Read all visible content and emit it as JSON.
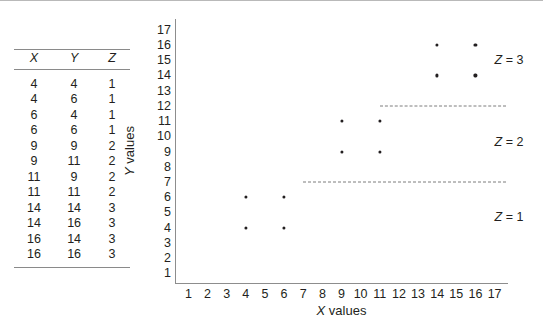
{
  "table": {
    "name": "xyz-data-table",
    "headers": [
      "X",
      "Y",
      "Z"
    ],
    "rows": [
      [
        "4",
        "4",
        "1"
      ],
      [
        "4",
        "6",
        "1"
      ],
      [
        "6",
        "4",
        "1"
      ],
      [
        "6",
        "6",
        "1"
      ],
      [
        "9",
        "9",
        "2"
      ],
      [
        "9",
        "11",
        "2"
      ],
      [
        "11",
        "9",
        "2"
      ],
      [
        "11",
        "11",
        "2"
      ],
      [
        "14",
        "14",
        "3"
      ],
      [
        "14",
        "16",
        "3"
      ],
      [
        "16",
        "14",
        "3"
      ],
      [
        "16",
        "16",
        "3"
      ]
    ]
  },
  "chart_data": {
    "type": "scatter",
    "title": "",
    "xlabel": "X values",
    "ylabel": "Y values",
    "xlim": [
      0.3,
      17.7
    ],
    "ylim": [
      0.3,
      17.7
    ],
    "xticks": [
      1,
      2,
      3,
      4,
      5,
      6,
      7,
      8,
      9,
      10,
      11,
      12,
      13,
      14,
      15,
      16,
      17
    ],
    "yticks": [
      1,
      2,
      3,
      4,
      5,
      6,
      7,
      8,
      9,
      10,
      11,
      12,
      13,
      14,
      15,
      16,
      17
    ],
    "xticklabels": [
      "1",
      "2",
      "3",
      "4",
      "5",
      "6",
      "7",
      "8",
      "9",
      "10",
      "11",
      "12",
      "13",
      "14",
      "15",
      "16",
      "17"
    ],
    "yticklabels": [
      "1",
      "2",
      "3",
      "4",
      "5",
      "6",
      "7",
      "8",
      "9",
      "10",
      "11",
      "12",
      "13",
      "14",
      "15",
      "16",
      "17"
    ],
    "grid": false,
    "legend": "none",
    "marker_color": "#231f20",
    "divider_color": "#7c7c7c",
    "axis_color": "#8d8d8d",
    "points": [
      {
        "x": 4,
        "y": 4,
        "z": 1
      },
      {
        "x": 4,
        "y": 6,
        "z": 1
      },
      {
        "x": 6,
        "y": 4,
        "z": 1
      },
      {
        "x": 6,
        "y": 6,
        "z": 1
      },
      {
        "x": 9,
        "y": 9,
        "z": 2
      },
      {
        "x": 9,
        "y": 11,
        "z": 2
      },
      {
        "x": 11,
        "y": 9,
        "z": 2
      },
      {
        "x": 11,
        "y": 11,
        "z": 2
      },
      {
        "x": 14,
        "y": 14,
        "z": 3
      },
      {
        "x": 14,
        "y": 16,
        "z": 3
      },
      {
        "x": 16,
        "y": 14,
        "z": 3
      },
      {
        "x": 16,
        "y": 16,
        "z": 3
      }
    ],
    "annotations": [
      {
        "text": "Z = 3",
        "symbol": "Z",
        "value": "3",
        "x": 17.0,
        "y": 15
      },
      {
        "text": "Z = 2",
        "symbol": "Z",
        "value": "2",
        "x": 17.0,
        "y": 9.6
      },
      {
        "text": "Z = 1",
        "symbol": "Z",
        "value": "1",
        "x": 17.0,
        "y": 4.7
      }
    ],
    "dividers": [
      {
        "y": 12,
        "x_start": 11.0,
        "x_end": 17.6
      },
      {
        "y": 7,
        "x_start": 7.0,
        "x_end": 17.6
      }
    ]
  }
}
